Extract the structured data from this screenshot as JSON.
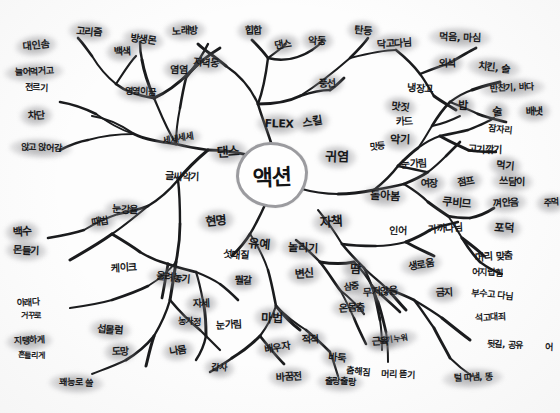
{
  "document": {
    "type": "hand-drawn-mind-map",
    "medium": "black marker on white paper with gray highlighter node halos",
    "center_label": "액션",
    "ink_color": "#17181a",
    "highlight_color": "#6e6e72",
    "hub_ring_color": "#9b9b9f",
    "paper_color": "#fdfdfd"
  },
  "nodes": [
    {
      "id": "hub",
      "text": "액션",
      "x": 272,
      "y": 175,
      "size": 22,
      "hl": false
    },
    {
      "id": "n1",
      "text": "댄스",
      "x": 228,
      "y": 152,
      "size": 13,
      "hl": true,
      "rot": "r2"
    },
    {
      "id": "n2",
      "text": "FLEX",
      "x": 279,
      "y": 124,
      "size": 11,
      "hl": true,
      "rot": "r3"
    },
    {
      "id": "n3",
      "text": "스킬",
      "x": 312,
      "y": 122,
      "size": 11,
      "hl": true,
      "rot": "r5"
    },
    {
      "id": "n4",
      "text": "귀염",
      "x": 337,
      "y": 157,
      "size": 13,
      "hl": true,
      "rot": "r3"
    },
    {
      "id": "n5",
      "text": "자책",
      "x": 331,
      "y": 222,
      "size": 13,
      "hl": true,
      "rot": "r2"
    },
    {
      "id": "n6",
      "text": "유예",
      "x": 259,
      "y": 244,
      "size": 12,
      "hl": true,
      "rot": "r4"
    },
    {
      "id": "n7",
      "text": "현명",
      "x": 216,
      "y": 221,
      "size": 12,
      "hl": true,
      "rot": "r1"
    },
    {
      "id": "n8",
      "text": "글씨악기",
      "x": 182,
      "y": 177,
      "size": 10,
      "hl": false,
      "rot": "r3"
    },
    {
      "id": "n9",
      "text": "세세세세",
      "x": 178,
      "y": 139,
      "size": 9,
      "hl": true,
      "rot": "r5"
    },
    {
      "id": "n10",
      "text": "앉고 앉어감",
      "x": 41,
      "y": 148,
      "size": 9,
      "hl": true,
      "rot": "r3"
    },
    {
      "id": "n11",
      "text": "차단",
      "x": 36,
      "y": 116,
      "size": 10,
      "hl": true,
      "rot": "r2"
    },
    {
      "id": "n12",
      "text": "늘어먹거고",
      "x": 34,
      "y": 72,
      "size": 9,
      "hl": true,
      "rot": "r2"
    },
    {
      "id": "n13",
      "text": "전르기",
      "x": 36,
      "y": 88,
      "size": 9,
      "hl": false,
      "rot": "r3"
    },
    {
      "id": "n14",
      "text": "대인솜",
      "x": 36,
      "y": 46,
      "size": 10,
      "hl": true,
      "rot": "r1"
    },
    {
      "id": "n15",
      "text": "고리즘",
      "x": 89,
      "y": 32,
      "size": 10,
      "hl": true,
      "rot": "r4"
    },
    {
      "id": "n16",
      "text": "백색",
      "x": 122,
      "y": 52,
      "size": 10,
      "hl": true,
      "rot": "r2"
    },
    {
      "id": "n17",
      "text": "영영이끔",
      "x": 140,
      "y": 92,
      "size": 9,
      "hl": true,
      "rot": "r3"
    },
    {
      "id": "n18",
      "text": "방생몬",
      "x": 143,
      "y": 40,
      "size": 10,
      "hl": true,
      "rot": "r6"
    },
    {
      "id": "n19",
      "text": "노래방",
      "x": 185,
      "y": 31,
      "size": 10,
      "hl": true,
      "rot": "r2"
    },
    {
      "id": "n20",
      "text": "염염",
      "x": 179,
      "y": 70,
      "size": 10,
      "hl": true,
      "rot": "r3"
    },
    {
      "id": "n21",
      "text": "저녁동",
      "x": 206,
      "y": 63,
      "size": 10,
      "hl": true,
      "rot": "r4"
    },
    {
      "id": "n22",
      "text": "힙합",
      "x": 253,
      "y": 31,
      "size": 10,
      "hl": true,
      "rot": "r2"
    },
    {
      "id": "n23",
      "text": "댄스",
      "x": 283,
      "y": 45,
      "size": 10,
      "hl": true,
      "rot": "r5"
    },
    {
      "id": "n24",
      "text": "악동",
      "x": 317,
      "y": 41,
      "size": 10,
      "hl": true,
      "rot": "r3"
    },
    {
      "id": "n25",
      "text": "풍선",
      "x": 327,
      "y": 84,
      "size": 10,
      "hl": true,
      "rot": "r2"
    },
    {
      "id": "n26",
      "text": "탄등",
      "x": 363,
      "y": 31,
      "size": 10,
      "hl": true,
      "rot": "r4"
    },
    {
      "id": "n27",
      "text": "닥고다님",
      "x": 394,
      "y": 44,
      "size": 10,
      "hl": true,
      "rot": "r2"
    },
    {
      "id": "n28",
      "text": "먹음, 마심",
      "x": 460,
      "y": 38,
      "size": 10,
      "hl": true,
      "rot": "r3"
    },
    {
      "id": "n29",
      "text": "외식",
      "x": 447,
      "y": 64,
      "size": 10,
      "hl": true,
      "rot": "r2"
    },
    {
      "id": "n30",
      "text": "치킨, 술",
      "x": 494,
      "y": 68,
      "size": 10,
      "hl": true,
      "rot": "r4"
    },
    {
      "id": "n31",
      "text": "냉장고",
      "x": 420,
      "y": 89,
      "size": 10,
      "hl": false,
      "rot": "r3"
    },
    {
      "id": "n32",
      "text": "반찬기, 바다",
      "x": 512,
      "y": 88,
      "size": 9,
      "hl": true,
      "rot": "r2"
    },
    {
      "id": "n33",
      "text": "밥",
      "x": 463,
      "y": 106,
      "size": 11,
      "hl": true,
      "rot": "r3"
    },
    {
      "id": "n34",
      "text": "술",
      "x": 497,
      "y": 112,
      "size": 11,
      "hl": true,
      "rot": "r5"
    },
    {
      "id": "n35",
      "text": "배냇",
      "x": 534,
      "y": 112,
      "size": 10,
      "hl": true,
      "rot": "r2"
    },
    {
      "id": "n36",
      "text": "잠자리",
      "x": 500,
      "y": 130,
      "size": 9,
      "hl": false,
      "rot": "r4"
    },
    {
      "id": "n37",
      "text": "카드",
      "x": 404,
      "y": 122,
      "size": 10,
      "hl": false,
      "rot": "r2"
    },
    {
      "id": "n38",
      "text": "맛짓",
      "x": 400,
      "y": 107,
      "size": 10,
      "hl": true,
      "rot": "r6"
    },
    {
      "id": "n39",
      "text": "악기",
      "x": 400,
      "y": 140,
      "size": 11,
      "hl": true,
      "rot": "r3"
    },
    {
      "id": "n40",
      "text": "맛등",
      "x": 377,
      "y": 147,
      "size": 9,
      "hl": false,
      "rot": "r2"
    },
    {
      "id": "n41",
      "text": "고기깎기",
      "x": 485,
      "y": 150,
      "size": 10,
      "hl": false,
      "rot": "r3"
    },
    {
      "id": "n42",
      "text": "먹기",
      "x": 505,
      "y": 166,
      "size": 10,
      "hl": true,
      "rot": "r4"
    },
    {
      "id": "n43",
      "text": "눈가림",
      "x": 414,
      "y": 164,
      "size": 10,
      "hl": false,
      "rot": "r2"
    },
    {
      "id": "n44",
      "text": "점프",
      "x": 466,
      "y": 182,
      "size": 10,
      "hl": true,
      "rot": "r5"
    },
    {
      "id": "n45",
      "text": "쓰담이",
      "x": 512,
      "y": 182,
      "size": 10,
      "hl": true,
      "rot": "r3"
    },
    {
      "id": "n46",
      "text": "여장",
      "x": 429,
      "y": 184,
      "size": 10,
      "hl": true,
      "rot": "r2"
    },
    {
      "id": "n47",
      "text": "쿠비므",
      "x": 457,
      "y": 203,
      "size": 11,
      "hl": true,
      "rot": "r4"
    },
    {
      "id": "n48",
      "text": "껴안음",
      "x": 506,
      "y": 203,
      "size": 10,
      "hl": true,
      "rot": "r2"
    },
    {
      "id": "n49",
      "text": "돌아봄",
      "x": 385,
      "y": 196,
      "size": 11,
      "hl": true,
      "rot": "r3"
    },
    {
      "id": "n50",
      "text": "가까다님",
      "x": 445,
      "y": 229,
      "size": 10,
      "hl": false,
      "rot": "r2"
    },
    {
      "id": "n51",
      "text": "포덕",
      "x": 504,
      "y": 228,
      "size": 11,
      "hl": true,
      "rot": "r4"
    },
    {
      "id": "n52",
      "text": "인어",
      "x": 398,
      "y": 231,
      "size": 10,
      "hl": false,
      "rot": "r3"
    },
    {
      "id": "n53",
      "text": "머리 맞춤",
      "x": 494,
      "y": 257,
      "size": 10,
      "hl": false,
      "rot": "r2"
    },
    {
      "id": "n54",
      "text": "어지럽힘",
      "x": 487,
      "y": 273,
      "size": 9,
      "hl": false,
      "rot": "r3"
    },
    {
      "id": "n55",
      "text": "생로움",
      "x": 421,
      "y": 265,
      "size": 10,
      "hl": true,
      "rot": "r5"
    },
    {
      "id": "n56",
      "text": "금지",
      "x": 444,
      "y": 293,
      "size": 10,
      "hl": true,
      "rot": "r2"
    },
    {
      "id": "n57",
      "text": "부수고 다님",
      "x": 492,
      "y": 295,
      "size": 9,
      "hl": false,
      "rot": "r4"
    },
    {
      "id": "n58",
      "text": "석고대죄",
      "x": 490,
      "y": 318,
      "size": 9,
      "hl": false,
      "rot": "r2"
    },
    {
      "id": "n59",
      "text": "뒷길, 공유",
      "x": 505,
      "y": 345,
      "size": 9,
      "hl": false,
      "rot": "r3"
    },
    {
      "id": "n60",
      "text": "무저않음",
      "x": 380,
      "y": 292,
      "size": 10,
      "hl": true,
      "rot": "r2"
    },
    {
      "id": "n61",
      "text": "땅기 누워",
      "x": 393,
      "y": 340,
      "size": 8,
      "hl": true,
      "rot": "r5"
    },
    {
      "id": "n62",
      "text": "머리 뜯기",
      "x": 398,
      "y": 375,
      "size": 9,
      "hl": false,
      "rot": "r3"
    },
    {
      "id": "n63",
      "text": "털 따냄, 똥",
      "x": 473,
      "y": 378,
      "size": 9,
      "hl": true,
      "rot": "r2"
    },
    {
      "id": "n64",
      "text": "놀리기",
      "x": 303,
      "y": 248,
      "size": 11,
      "hl": true,
      "rot": "r3"
    },
    {
      "id": "n65",
      "text": "변신",
      "x": 304,
      "y": 274,
      "size": 11,
      "hl": true,
      "rot": "r2"
    },
    {
      "id": "n66",
      "text": "섯대질",
      "x": 236,
      "y": 255,
      "size": 10,
      "hl": false,
      "rot": "r4"
    },
    {
      "id": "n67",
      "text": "뭘갈",
      "x": 243,
      "y": 281,
      "size": 10,
      "hl": true,
      "rot": "r2"
    },
    {
      "id": "n68",
      "text": "마법",
      "x": 272,
      "y": 318,
      "size": 12,
      "hl": true,
      "rot": "r3"
    },
    {
      "id": "n69",
      "text": "눈가림",
      "x": 229,
      "y": 325,
      "size": 10,
      "hl": false,
      "rot": "r2"
    },
    {
      "id": "n70",
      "text": "배우자",
      "x": 277,
      "y": 348,
      "size": 10,
      "hl": true,
      "rot": "r5"
    },
    {
      "id": "n71",
      "text": "바꿈전",
      "x": 289,
      "y": 377,
      "size": 10,
      "hl": true,
      "rot": "r2"
    },
    {
      "id": "n72",
      "text": "바둑",
      "x": 337,
      "y": 358,
      "size": 10,
      "hl": true,
      "rot": "r4"
    },
    {
      "id": "n73",
      "text": "출랑출랑",
      "x": 340,
      "y": 382,
      "size": 9,
      "hl": true,
      "rot": "r3"
    },
    {
      "id": "n74",
      "text": "적적",
      "x": 310,
      "y": 340,
      "size": 10,
      "hl": true,
      "rot": "r2"
    },
    {
      "id": "n75",
      "text": "땀",
      "x": 355,
      "y": 269,
      "size": 12,
      "hl": true,
      "rot": "r3"
    },
    {
      "id": "n76",
      "text": "근육",
      "x": 380,
      "y": 342,
      "size": 10,
      "hl": true,
      "rot": "r2"
    },
    {
      "id": "n77",
      "text": "춤해짐",
      "x": 358,
      "y": 372,
      "size": 9,
      "hl": false,
      "rot": "r4"
    },
    {
      "id": "n78",
      "text": "온몸춤",
      "x": 352,
      "y": 308,
      "size": 10,
      "hl": true,
      "rot": "r2"
    },
    {
      "id": "n79",
      "text": "눈강율",
      "x": 125,
      "y": 210,
      "size": 10,
      "hl": true,
      "rot": "r3"
    },
    {
      "id": "n80",
      "text": "때법",
      "x": 100,
      "y": 222,
      "size": 10,
      "hl": true,
      "rot": "r5"
    },
    {
      "id": "n81",
      "text": "백수",
      "x": 22,
      "y": 232,
      "size": 11,
      "hl": true,
      "rot": "r2"
    },
    {
      "id": "n82",
      "text": "몬들기",
      "x": 26,
      "y": 251,
      "size": 10,
      "hl": true,
      "rot": "r3"
    },
    {
      "id": "n83",
      "text": "케이크",
      "x": 124,
      "y": 268,
      "size": 10,
      "hl": false,
      "rot": "r2"
    },
    {
      "id": "n84",
      "text": "올려놓기",
      "x": 173,
      "y": 278,
      "size": 10,
      "hl": true,
      "rot": "r4"
    },
    {
      "id": "n85",
      "text": "아래다",
      "x": 28,
      "y": 303,
      "size": 9,
      "hl": false,
      "rot": "r2"
    },
    {
      "id": "n86",
      "text": "거꾸로",
      "x": 31,
      "y": 316,
      "size": 8,
      "hl": false,
      "rot": "r3"
    },
    {
      "id": "n87",
      "text": "지탱하게",
      "x": 29,
      "y": 341,
      "size": 9,
      "hl": true,
      "rot": "r2"
    },
    {
      "id": "n88",
      "text": "흔들리게",
      "x": 31,
      "y": 356,
      "size": 8,
      "hl": false,
      "rot": "r3"
    },
    {
      "id": "n89",
      "text": "섭몰럼",
      "x": 110,
      "y": 330,
      "size": 10,
      "hl": true,
      "rot": "r4"
    },
    {
      "id": "n90",
      "text": "도망",
      "x": 120,
      "y": 352,
      "size": 10,
      "hl": true,
      "rot": "r2"
    },
    {
      "id": "n91",
      "text": "꽤능로 쓸",
      "x": 76,
      "y": 383,
      "size": 9,
      "hl": true,
      "rot": "r3"
    },
    {
      "id": "n92",
      "text": "나몸",
      "x": 178,
      "y": 351,
      "size": 10,
      "hl": true,
      "rot": "r5"
    },
    {
      "id": "n93",
      "text": "자세",
      "x": 201,
      "y": 304,
      "size": 10,
      "hl": true,
      "rot": "r2"
    },
    {
      "id": "n94",
      "text": "농가정",
      "x": 189,
      "y": 322,
      "size": 9,
      "hl": true,
      "rot": "r3"
    },
    {
      "id": "n95",
      "text": "삼중",
      "x": 351,
      "y": 287,
      "size": 9,
      "hl": true,
      "rot": "r2"
    },
    {
      "id": "n96",
      "text": "갑사",
      "x": 219,
      "y": 368,
      "size": 9,
      "hl": true,
      "rot": "r4"
    },
    {
      "id": "n97",
      "text": "주먹",
      "x": 551,
      "y": 203,
      "size": 9,
      "hl": true,
      "rot": "r2"
    },
    {
      "id": "n98",
      "text": "어",
      "x": 549,
      "y": 348,
      "size": 9,
      "hl": false,
      "rot": "r3"
    }
  ],
  "edges": [
    "M272,146 C268,132 262,118 258,104",
    "M258,104 C250,86 238,74 226,66",
    "M226,66 C214,56 204,50 198,44",
    "M258,104 C264,88 266,74 268,58",
    "M268,58 C262,50 256,44 252,40",
    "M268,58 C276,52 282,48 286,44",
    "M268,58 C284,62 300,58 312,50",
    "M312,50 C318,46 320,44 322,42",
    "M258,104 C272,104 288,102 300,96",
    "M300,96 C312,92 322,90 330,90",
    "M330,90 C336,86 340,82 344,78",
    "M300,96 C316,86 334,72 350,58",
    "M350,58 C358,50 364,44 368,38",
    "M350,58 C366,54 382,50 396,50",
    "M252,156 C236,152 222,150 208,150",
    "M208,150 C194,148 184,146 176,144",
    "M176,144 C160,142 146,140 134,134",
    "M134,134 C120,130 108,122 96,114",
    "M96,114 C84,108 72,104 60,102",
    "M176,144 C166,128 160,112 154,98",
    "M154,98 C148,84 144,72 142,60",
    "M142,60 C140,52 140,46 140,42",
    "M154,98 C140,96 126,92 116,84",
    "M116,84 C106,76 98,66 92,56",
    "M92,56 C86,48 82,42 78,38",
    "M116,84 C124,72 130,62 136,56",
    "M154,98 C168,92 180,82 190,72",
    "M190,72 C198,62 204,52 208,44",
    "M190,72 C200,62 210,54 220,48",
    "M134,134 C118,134 102,136 88,140",
    "M88,140 C76,142 68,146 60,150",
    "M134,134 C120,124 106,118 92,116",
    "M208,150 C196,160 186,170 178,180",
    "M178,180 C168,192 158,200 148,206",
    "M148,206 C138,210 128,212 118,214",
    "M118,214 C106,218 94,224 84,230",
    "M84,230 C72,234 60,236 48,238",
    "M148,206 C136,216 124,226 112,234",
    "M112,234 C98,244 84,252 70,260",
    "M178,180 C180,196 180,210 180,224",
    "M180,224 C180,240 178,252 176,262",
    "M176,262 C168,272 158,280 148,286",
    "M148,286 C136,292 124,296 112,300",
    "M112,300 C98,304 84,306 70,308",
    "M176,262 C174,276 172,288 170,300",
    "M170,300 C166,314 160,326 154,336",
    "M154,336 C146,346 136,354 126,360",
    "M126,360 C114,366 102,370 92,374",
    "M170,300 C180,312 190,322 200,330",
    "M200,330 C208,338 214,344 220,350",
    "M154,336 C150,348 148,358 146,366",
    "M268,198 C262,212 256,224 250,234",
    "M250,234 C244,244 238,250 232,256",
    "M250,234 C258,246 264,258 268,270",
    "M268,270 C272,284 274,296 276,306",
    "M276,306 C272,318 266,328 260,336",
    "M260,336 C252,344 242,352 232,358",
    "M232,358 C224,364 216,368 210,372",
    "M260,336 C268,346 276,356 284,364",
    "M276,306 C286,316 296,324 306,330",
    "M306,330 C316,338 324,346 330,352",
    "M330,352 C334,362 336,370 338,376",
    "M276,306 C284,316 292,324 300,330",
    "M296,240 C306,248 314,256 320,262",
    "M320,262 C328,272 334,282 340,290",
    "M340,290 C346,300 350,310 354,318",
    "M354,318 C358,328 362,336 366,344",
    "M340,290 C350,298 358,306 364,314",
    "M320,262 C332,264 344,264 354,262",
    "M354,262 C362,270 368,278 372,286",
    "M372,286 C376,298 378,310 380,320",
    "M380,320 C382,332 382,342 382,350",
    "M372,286 C382,296 392,304 400,312",
    "M298,188 C312,192 326,194 338,194",
    "M338,194 C352,194 364,192 374,190",
    "M374,190 C386,188 396,186 404,184",
    "M404,184 C414,180 422,176 428,172",
    "M428,172 C436,166 442,160 446,156",
    "M446,156 C452,150 456,146 460,142",
    "M404,184 C414,190 422,196 428,202",
    "M428,202 C436,208 442,212 448,216",
    "M448,216 C456,218 464,218 470,218",
    "M470,218 C480,216 488,212 494,208",
    "M448,216 C454,224 458,232 462,238",
    "M462,238 C468,248 474,256 480,262",
    "M480,262 C488,268 496,272 502,274",
    "M462,238 C470,244 478,250 484,256",
    "M374,190 C384,182 392,174 398,166",
    "M398,166 C406,158 412,152 418,148",
    "M418,148 C426,142 434,138 440,136",
    "M440,136 C450,134 460,132 468,130",
    "M468,130 C478,126 488,122 494,118",
    "M440,136 C450,142 460,146 468,150",
    "M468,150 C478,152 488,152 496,152",
    "M398,166 C408,168 418,170 426,172",
    "M418,148 C424,140 428,132 432,126",
    "M432,126 C438,116 444,108 450,102",
    "M450,102 C458,96 466,92 472,90",
    "M472,90 C482,86 492,84 500,82",
    "M450,102 C460,106 470,110 478,114",
    "M478,114 C488,118 498,120 506,122",
    "M432,126 C442,124 452,120 460,116",
    "M396,50 C406,58 414,66 420,74",
    "M420,74 C426,82 430,90 434,96",
    "M434,96 C442,102 450,106 456,110",
    "M420,74 C430,70 440,66 448,64",
    "M448,64 C458,58 468,52 476,48",
    "M318,210 C328,222 336,234 342,244",
    "M342,244 C350,254 358,262 364,268",
    "M364,268 C372,276 380,282 386,288",
    "M386,288 C394,296 400,304 406,310",
    "M364,268 C370,280 374,292 378,302",
    "M378,302 C382,314 384,324 386,332",
    "M386,332 C388,344 388,354 388,362",
    "M386,288 C396,292 406,296 414,300",
    "M414,300 C424,306 434,312 442,318",
    "M442,318 C452,326 462,334 470,340",
    "M414,300 C422,310 428,320 434,328",
    "M434,328 C440,340 446,350 450,358",
    "M450,358 C458,366 466,372 472,376",
    "M342,244 C354,246 366,246 376,246",
    "M376,246 C388,246 398,244 406,242",
    "M406,242 C416,238 424,234 430,230",
    "M430,230 C440,226 450,224 458,222",
    "M406,242 C416,248 426,252 434,256",
    "M176,144 C176,130 178,118 180,108",
    "M180,108 C182,96 184,86 186,78",
    "M186,78 C192,70 198,64 204,60",
    "M112,234 C122,240 132,246 140,252",
    "M140,252 C150,258 160,262 168,264",
    "M168,264 C178,268 188,270 196,272",
    "M196,272 C206,276 214,280 220,284",
    "M220,284 C228,290 234,296 238,300",
    "M196,272 C200,284 202,296 204,306",
    "M204,306 C206,318 206,328 206,336",
    "M206,336 C204,346 200,354 196,360",
    "M168,264 C166,276 164,288 162,298"
  ]
}
